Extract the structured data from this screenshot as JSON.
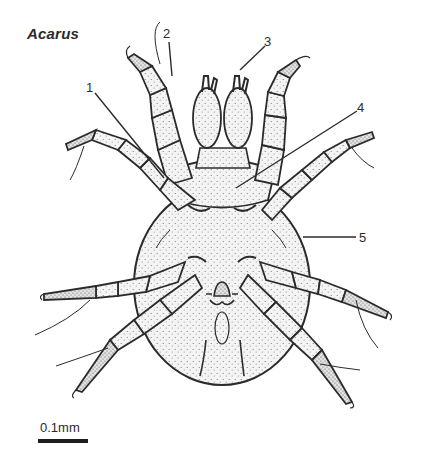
{
  "figure": {
    "title": "Acarus",
    "labels": [
      {
        "id": "1",
        "text": "1"
      },
      {
        "id": "2",
        "text": "2"
      },
      {
        "id": "3",
        "text": "3"
      },
      {
        "id": "4",
        "text": "4"
      },
      {
        "id": "5",
        "text": "5"
      }
    ],
    "scale_bar": {
      "label": "0.1mm"
    },
    "colors": {
      "ink": "#2b2b2b",
      "fill": "#f2f2f2",
      "stipple": "#6a6a6a",
      "background": "#ffffff"
    }
  }
}
